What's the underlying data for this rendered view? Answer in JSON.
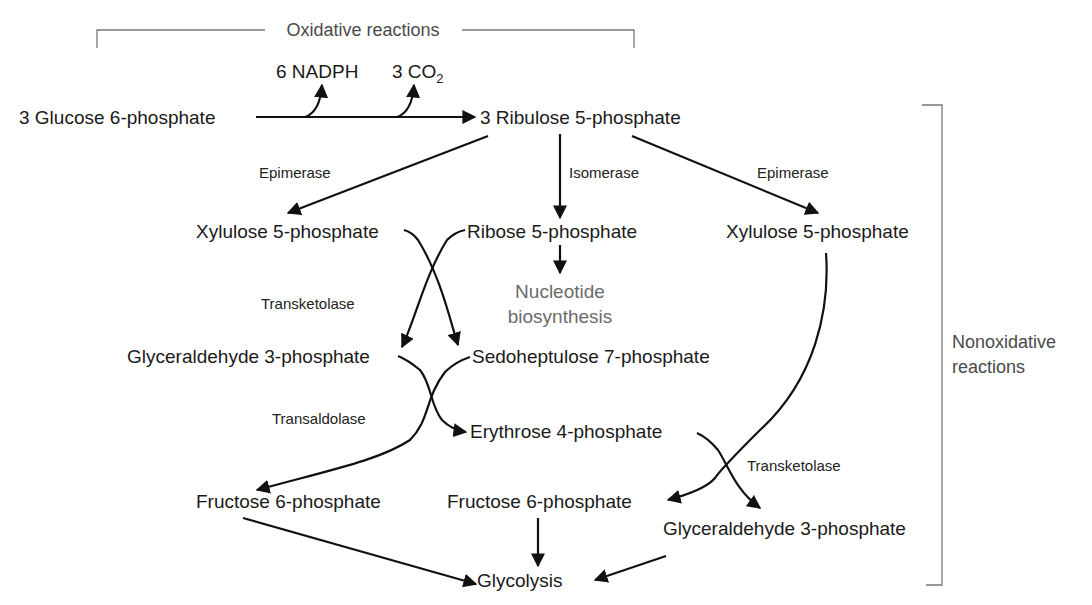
{
  "sections": {
    "oxidative": "Oxidative reactions",
    "nonoxidative_line1": "Nonoxidative",
    "nonoxidative_line2": "reactions"
  },
  "products": {
    "nadph": "6 NADPH",
    "co2_prefix": "3 CO",
    "co2_sub": "2"
  },
  "nodes": {
    "glucose6p": "3 Glucose 6-phosphate",
    "ribulose5p": "3 Ribulose 5-phosphate",
    "xylulose5p_left": "Xylulose 5-phosphate",
    "ribose5p": "Ribose 5-phosphate",
    "xylulose5p_right": "Xylulose 5-phosphate",
    "nucleotide_line1": "Nucleotide",
    "nucleotide_line2": "biosynthesis",
    "glyceraldehyde3p_left": "Glyceraldehyde 3-phosphate",
    "sedoheptulose7p": "Sedoheptulose 7-phosphate",
    "erythrose4p": "Erythrose 4-phosphate",
    "fructose6p_left": "Fructose 6-phosphate",
    "fructose6p_mid": "Fructose 6-phosphate",
    "glyceraldehyde3p_right": "Glyceraldehyde 3-phosphate",
    "glycolysis": "Glycolysis"
  },
  "enzymes": {
    "epimerase_left": "Epimerase",
    "isomerase": "Isomerase",
    "epimerase_right": "Epimerase",
    "transketolase_1": "Transketolase",
    "transaldolase": "Transaldolase",
    "transketolase_2": "Transketolase"
  }
}
